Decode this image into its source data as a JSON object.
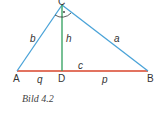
{
  "figure": {
    "caption": "Bild 4.2",
    "vertices": {
      "A": {
        "label": "A",
        "x": 17,
        "y": 71
      },
      "B": {
        "label": "B",
        "x": 148,
        "y": 71
      },
      "C": {
        "label": "C",
        "x": 62,
        "y": 4
      },
      "D": {
        "label": "D",
        "x": 62,
        "y": 71
      }
    },
    "segments": {
      "a": {
        "label": "a",
        "from": "C",
        "to": "B"
      },
      "b": {
        "label": "b",
        "from": "A",
        "to": "C"
      },
      "c": {
        "label": "c",
        "from": "A",
        "to": "B"
      },
      "h": {
        "label": "h",
        "from": "C",
        "to": "D"
      },
      "p": {
        "label": "p",
        "from": "D",
        "to": "B"
      },
      "q": {
        "label": "q",
        "from": "A",
        "to": "D"
      }
    },
    "right_angle_at": "C",
    "colors": {
      "legs": "#4aa3d8",
      "hypotenuse": "#d9452b",
      "height": "#2e9e5b",
      "text": "#333333"
    }
  }
}
